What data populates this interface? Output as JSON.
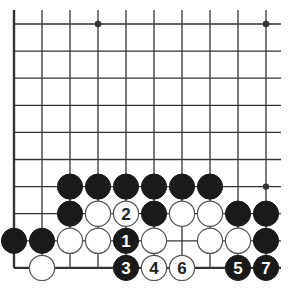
{
  "diagram": {
    "type": "go-board-fragment",
    "grid": {
      "columns": 10,
      "rows": 10,
      "origin_x": 14,
      "origin_y": 24,
      "spacing_x": 28,
      "spacing_y": 27.1,
      "open_top": true,
      "open_right": true,
      "edge_left": true,
      "edge_bottom": true
    },
    "colors": {
      "line": "#333333",
      "black_stone": "#1a1a1a",
      "white_stone_fill": "#ffffff",
      "white_stone_stroke": "#555555",
      "black_label": "#ffffff",
      "white_label": "#222222"
    },
    "star_points": [
      {
        "col": 3,
        "row": 0
      },
      {
        "col": 9,
        "row": 0
      },
      {
        "col": 9,
        "row": 6
      }
    ],
    "stones": [
      {
        "col": 2,
        "row": 6,
        "color": "black",
        "label": ""
      },
      {
        "col": 3,
        "row": 6,
        "color": "black",
        "label": ""
      },
      {
        "col": 4,
        "row": 6,
        "color": "black",
        "label": ""
      },
      {
        "col": 5,
        "row": 6,
        "color": "black",
        "label": ""
      },
      {
        "col": 6,
        "row": 6,
        "color": "black",
        "label": ""
      },
      {
        "col": 7,
        "row": 6,
        "color": "black",
        "label": ""
      },
      {
        "col": 2,
        "row": 7,
        "color": "black",
        "label": ""
      },
      {
        "col": 3,
        "row": 7,
        "color": "white",
        "label": ""
      },
      {
        "col": 4,
        "row": 7,
        "color": "white",
        "label": "2"
      },
      {
        "col": 5,
        "row": 7,
        "color": "black",
        "label": ""
      },
      {
        "col": 6,
        "row": 7,
        "color": "white",
        "label": ""
      },
      {
        "col": 7,
        "row": 7,
        "color": "white",
        "label": ""
      },
      {
        "col": 8,
        "row": 7,
        "color": "black",
        "label": ""
      },
      {
        "col": 9,
        "row": 7,
        "color": "black",
        "label": ""
      },
      {
        "col": 0,
        "row": 8,
        "color": "black",
        "label": ""
      },
      {
        "col": 1,
        "row": 8,
        "color": "black",
        "label": ""
      },
      {
        "col": 2,
        "row": 8,
        "color": "white",
        "label": ""
      },
      {
        "col": 3,
        "row": 8,
        "color": "white",
        "label": ""
      },
      {
        "col": 4,
        "row": 8,
        "color": "black",
        "label": "1"
      },
      {
        "col": 5,
        "row": 8,
        "color": "white",
        "label": ""
      },
      {
        "col": 7,
        "row": 8,
        "color": "white",
        "label": ""
      },
      {
        "col": 8,
        "row": 8,
        "color": "white",
        "label": ""
      },
      {
        "col": 9,
        "row": 8,
        "color": "black",
        "label": ""
      },
      {
        "col": 1,
        "row": 9,
        "color": "white",
        "label": ""
      },
      {
        "col": 4,
        "row": 9,
        "color": "black",
        "label": "3"
      },
      {
        "col": 5,
        "row": 9,
        "color": "white",
        "label": "4"
      },
      {
        "col": 6,
        "row": 9,
        "color": "white",
        "label": "6"
      },
      {
        "col": 8,
        "row": 9,
        "color": "black",
        "label": "5"
      },
      {
        "col": 9,
        "row": 9,
        "color": "black",
        "label": "7"
      }
    ]
  }
}
